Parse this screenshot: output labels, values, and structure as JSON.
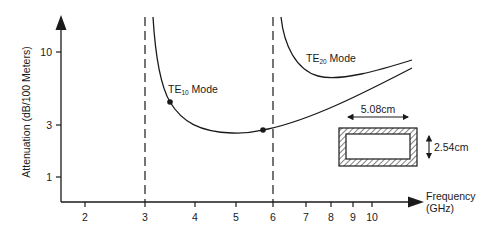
{
  "chart_data": {
    "type": "line",
    "title": "",
    "xlabel": "Frequency (GHz)",
    "xlabel_lines": [
      "Frequency",
      "(GHz)"
    ],
    "ylabel": "Attenuation (dB/100 Meters)",
    "xscale": "log",
    "yscale": "log",
    "x_ticks": [
      2,
      3,
      4,
      5,
      6,
      7,
      8,
      9,
      10
    ],
    "y_ticks": [
      1,
      3,
      10
    ],
    "xlim": [
      1.7,
      14
    ],
    "ylim": [
      0.6,
      18
    ],
    "grid": false,
    "legend": null,
    "cutoff_lines": [
      {
        "name": "TE10 cutoff",
        "x": 2.95
      },
      {
        "name": "TE20 cutoff",
        "x": 5.9
      }
    ],
    "series": [
      {
        "name": "TE10 Mode",
        "label_main": "TE",
        "label_sub": "10",
        "label_suffix": " Mode",
        "x": [
          3.15,
          3.3,
          3.5,
          3.8,
          4.2,
          4.7,
          5.2,
          5.8,
          6.5,
          7.5,
          8.5,
          10,
          12.5
        ],
        "y": [
          18,
          7.5,
          4.6,
          3.6,
          3.0,
          2.75,
          2.75,
          2.85,
          3.1,
          3.6,
          4.1,
          4.9,
          6.2
        ],
        "markers": [
          {
            "x": 3.45,
            "y": 4.6
          },
          {
            "x": 5.7,
            "y": 2.85
          }
        ]
      },
      {
        "name": "TE20 Mode",
        "label_main": "TE",
        "label_sub": "20",
        "label_suffix": " Mode",
        "x": [
          6.3,
          6.5,
          6.8,
          7.3,
          8.0,
          9.0,
          10.5,
          12.5
        ],
        "y": [
          18,
          10.5,
          7.8,
          6.7,
          6.4,
          6.6,
          7.4,
          8.3
        ]
      }
    ],
    "annotations": [
      {
        "type": "waveguide-cross-section",
        "width_label": "5.08cm",
        "height_label": "2.54cm"
      }
    ]
  },
  "labels": {
    "y_axis_title": "Attenuation (dB/100 Meters)",
    "x_axis_title_line1": "Frequency",
    "x_axis_title_line2": "(GHz)",
    "te10_main": "TE",
    "te10_sub": "10",
    "te10_suffix": " Mode",
    "te20_main": "TE",
    "te20_sub": "20",
    "te20_suffix": " Mode",
    "waveguide_width": "5.08cm",
    "waveguide_height": "2.54cm"
  }
}
